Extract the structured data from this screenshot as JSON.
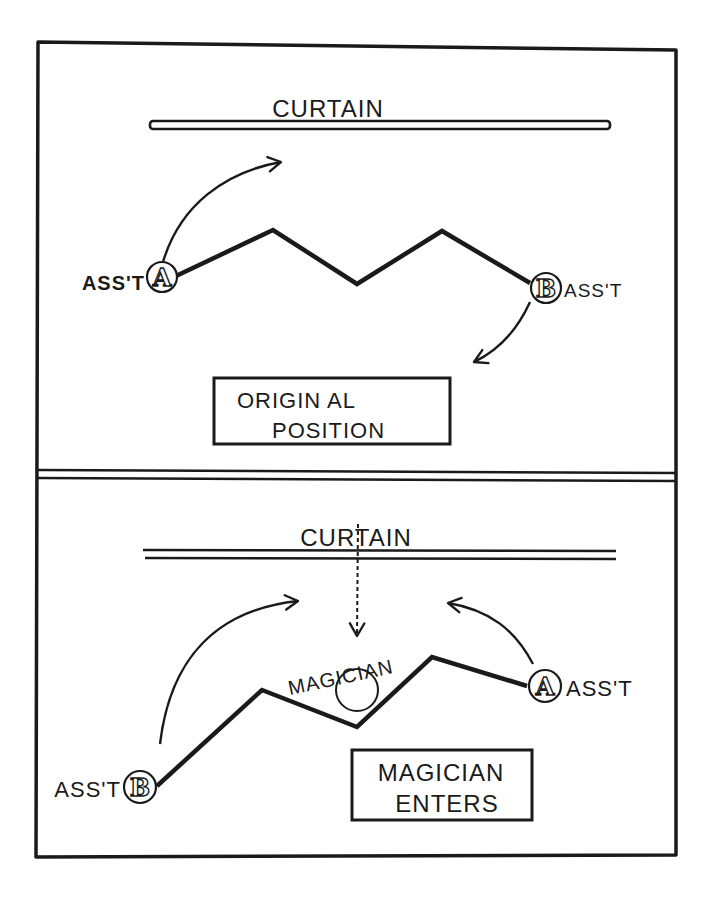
{
  "colors": {
    "ink": "#1a1a1a",
    "paper": "#ffffff"
  },
  "top_panel": {
    "curtain_label": "CURTAIN",
    "assistant_a": {
      "letter": "A",
      "label": "ASS'T"
    },
    "assistant_b": {
      "letter": "B",
      "label": "ASS'T"
    },
    "caption_line1": "ORIGIN AL",
    "caption_line2": "POSITION"
  },
  "bottom_panel": {
    "curtain_label": "CURTAIN",
    "magician_label": "MAGICIAN",
    "assistant_a": {
      "letter": "A",
      "label": "ASS'T"
    },
    "assistant_b": {
      "letter": "B",
      "label": "ASS'T"
    },
    "caption_line1": "MAGICIAN",
    "caption_line2": "ENTERS"
  }
}
